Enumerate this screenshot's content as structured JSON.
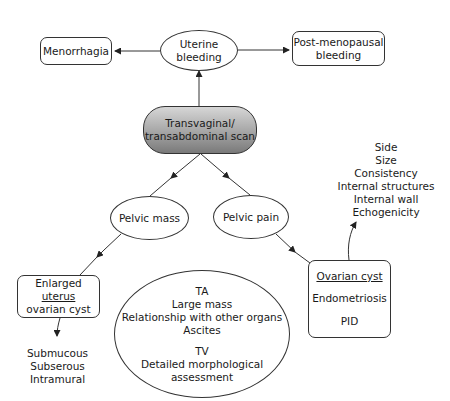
{
  "diagram": {
    "root": {
      "line1": "Transvaginal/",
      "line2": "transabdominal scan"
    },
    "uterine_bleeding": {
      "line1": "Uterine",
      "line2": "bleeding"
    },
    "menorrhagia": {
      "label": "Menorrhagia"
    },
    "post_menopausal": {
      "line1": "Post-menopausal",
      "line2": "bleeding"
    },
    "pelvic_mass": {
      "label": "Pelvic mass"
    },
    "pelvic_pain": {
      "label": "Pelvic pain"
    },
    "enlarged_uterus": {
      "line1_pre": "Enlarged ",
      "line1_u": "uterus",
      "line2": "ovarian cyst"
    },
    "fibroid_types": [
      "Submucous",
      "Subserous",
      "Intramural"
    ],
    "ovarian_box": {
      "title": "Ovarian cyst",
      "item2": "Endometriosis",
      "item3": "PID"
    },
    "cyst_features": [
      "Side",
      "Size",
      "Consistency",
      "Internal structures",
      "Internal wall",
      "Echogenicity"
    ],
    "ta_tv": {
      "ta_title": "TA",
      "ta_items": [
        "Large mass",
        "Relationship with other organs",
        "Ascites"
      ],
      "tv_title": "TV",
      "tv_items": [
        "Detailed morphological",
        "assessment"
      ]
    },
    "colors": {
      "line": "#333333",
      "scan_gradient_top": "#d6d6d6",
      "scan_gradient_bottom": "#7a7a7a"
    }
  }
}
